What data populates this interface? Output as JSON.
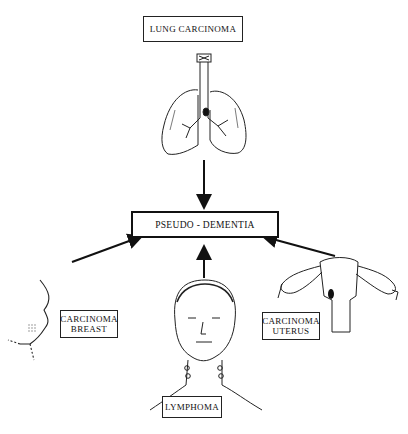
{
  "diagram": {
    "center": {
      "label": "PSEUDO - DEMENTIA"
    },
    "sources": [
      {
        "id": "lung",
        "label": "LUNG CARCINOMA",
        "illustration": "lungs-icon"
      },
      {
        "id": "breast",
        "line1": "CARCINOMA",
        "line2": "BREAST",
        "illustration": "breast-icon"
      },
      {
        "id": "lymphoma",
        "label": "LYMPHOMA",
        "illustration": "head-neck-icon"
      },
      {
        "id": "uterus",
        "line1": "CARCINOMA",
        "line2": "UTERUS",
        "illustration": "uterus-icon"
      }
    ],
    "arrows": [
      {
        "from": "lung",
        "to": "center"
      },
      {
        "from": "breast",
        "to": "center"
      },
      {
        "from": "lymphoma",
        "to": "center"
      },
      {
        "from": "uterus",
        "to": "center"
      }
    ]
  }
}
